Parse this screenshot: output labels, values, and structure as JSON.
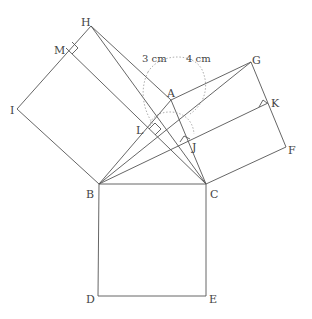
{
  "diagram": {
    "title": "",
    "points": {
      "A": {
        "label": "A"
      },
      "B": {
        "label": "B"
      },
      "C": {
        "label": "C"
      },
      "D": {
        "label": "D"
      },
      "E": {
        "label": "E"
      },
      "F": {
        "label": "F"
      },
      "G": {
        "label": "G"
      },
      "H": {
        "label": "H"
      },
      "I": {
        "label": "I"
      },
      "J": {
        "label": "J"
      },
      "K": {
        "label": "K"
      },
      "L": {
        "label": "L"
      },
      "M": {
        "label": "M"
      }
    },
    "measurements": {
      "ab": "3 cm",
      "ac": "4 cm"
    }
  }
}
